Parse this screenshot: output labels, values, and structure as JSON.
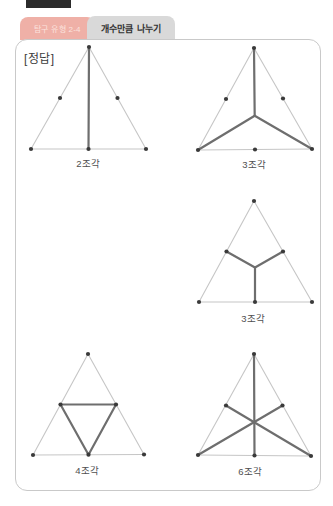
{
  "page": {
    "header": {
      "tab_unit": "탐구 유형 2-4",
      "tab_title": "개수만큼 나누기"
    },
    "answer_label": "[정답]"
  },
  "colors": {
    "tab_unit_bg": "#efb0a7",
    "tab_unit_text": "#fbe3de",
    "tab_title_bg": "#d9d9d9",
    "card_border": "#c9c9c9",
    "thin_line": "#c6c6c6",
    "thick_line": "#6e6e6e",
    "dot": "#3a3a3a",
    "bookmark": "#2b2b2b"
  },
  "figures": [
    {
      "label": "2조각",
      "label_pos": [
        88,
        156
      ],
      "points": {
        "apex": [
          89,
          47
        ],
        "bl": [
          31,
          149
        ],
        "br": [
          146,
          149
        ],
        "ml": [
          60,
          98
        ],
        "mr": [
          117.5,
          98
        ],
        "mb": [
          88.5,
          149
        ]
      },
      "thin_edges": [
        [
          "apex",
          "bl"
        ],
        [
          "apex",
          "br"
        ],
        [
          "bl",
          "br"
        ]
      ],
      "thick_edges": [
        [
          "apex",
          "mb"
        ]
      ],
      "dots": [
        "apex",
        "bl",
        "br",
        "ml",
        "mr",
        "mb"
      ]
    },
    {
      "label": "3조각",
      "label_pos": [
        254,
        157
      ],
      "points": {
        "apex": [
          254,
          48
        ],
        "bl": [
          198,
          150
        ],
        "br": [
          312,
          149
        ],
        "ml": [
          226,
          99
        ],
        "mr": [
          283,
          98.5
        ],
        "mb": [
          255,
          149.5
        ],
        "c": [
          254.7,
          115.7
        ]
      },
      "thin_edges": [
        [
          "apex",
          "bl"
        ],
        [
          "apex",
          "br"
        ],
        [
          "bl",
          "br"
        ]
      ],
      "thick_edges": [
        [
          "apex",
          "c"
        ],
        [
          "c",
          "bl"
        ],
        [
          "c",
          "br"
        ]
      ],
      "dots": [
        "apex",
        "bl",
        "br",
        "ml",
        "mr",
        "mb"
      ]
    },
    {
      "label": "3조각",
      "label_pos": [
        253,
        311
      ],
      "points": {
        "apex": [
          254,
          201
        ],
        "bl": [
          199,
          302
        ],
        "br": [
          312,
          302
        ],
        "ml": [
          226.5,
          251.5
        ],
        "mr": [
          283,
          251.5
        ],
        "mb": [
          255,
          302
        ],
        "c": [
          255,
          267.5
        ]
      },
      "thin_edges": [
        [
          "apex",
          "bl"
        ],
        [
          "apex",
          "br"
        ],
        [
          "bl",
          "br"
        ]
      ],
      "thick_edges": [
        [
          "c",
          "ml"
        ],
        [
          "c",
          "mr"
        ],
        [
          "c",
          "mb"
        ]
      ],
      "dots": [
        "apex",
        "bl",
        "br",
        "ml",
        "mr",
        "mb"
      ]
    },
    {
      "label": "4조각",
      "label_pos": [
        87,
        463
      ],
      "points": {
        "apex": [
          88,
          354
        ],
        "bl": [
          33,
          455
        ],
        "br": [
          144,
          454.5
        ],
        "ml": [
          60.5,
          404.5
        ],
        "mr": [
          116,
          404.5
        ],
        "mb": [
          88.5,
          454.7
        ]
      },
      "thin_edges": [
        [
          "apex",
          "bl"
        ],
        [
          "apex",
          "br"
        ],
        [
          "bl",
          "br"
        ]
      ],
      "thick_edges": [
        [
          "ml",
          "mr"
        ],
        [
          "ml",
          "mb"
        ],
        [
          "mr",
          "mb"
        ]
      ],
      "dots": [
        "apex",
        "bl",
        "br",
        "ml",
        "mr",
        "mb"
      ]
    },
    {
      "label": "6조각",
      "label_pos": [
        250,
        464
      ],
      "points": {
        "apex": [
          254,
          354
        ],
        "bl": [
          198,
          455
        ],
        "br": [
          311,
          456
        ],
        "ml": [
          226,
          405.5
        ],
        "mr": [
          282.5,
          405.5
        ],
        "mb": [
          254.5,
          455.5
        ]
      },
      "thin_edges": [
        [
          "apex",
          "bl"
        ],
        [
          "apex",
          "br"
        ],
        [
          "bl",
          "br"
        ]
      ],
      "thick_edges": [
        [
          "apex",
          "mb"
        ],
        [
          "bl",
          "mr"
        ],
        [
          "br",
          "ml"
        ]
      ],
      "dots": [
        "apex",
        "bl",
        "br",
        "ml",
        "mr",
        "mb"
      ]
    }
  ]
}
